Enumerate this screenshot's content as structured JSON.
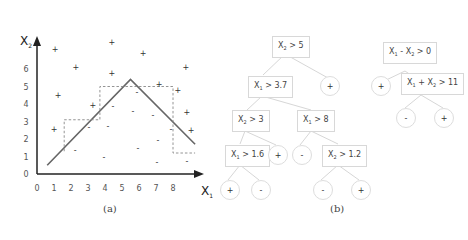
{
  "panel_a": {
    "caption": "(a)",
    "chart_data": {
      "type": "scatter",
      "title": "",
      "xlabel": "X",
      "xlabel_sub": "1",
      "ylabel": "X",
      "ylabel_sub": "2",
      "x_ticks": [
        "0",
        "1",
        "2",
        "3",
        "4",
        "5",
        "6",
        "7",
        "8"
      ],
      "y_ticks": [
        "0",
        "1",
        "2",
        "3",
        "4",
        "5",
        "6"
      ],
      "xlim": [
        0,
        9.5
      ],
      "ylim": [
        0,
        8
      ],
      "grid": false,
      "series": [
        {
          "name": "positive",
          "marker": "+",
          "points": [
            [
              1.06,
              7.14
            ],
            [
              1.24,
              4.51
            ],
            [
              1.0,
              2.57
            ],
            [
              2.29,
              6.11
            ],
            [
              3.29,
              3.94
            ],
            [
              4.41,
              7.54
            ],
            [
              4.41,
              5.77
            ],
            [
              6.24,
              6.86
            ],
            [
              7.18,
              5.14
            ],
            [
              8.29,
              4.8
            ],
            [
              8.76,
              6.06
            ],
            [
              8.82,
              3.49
            ],
            [
              9.06,
              2.46
            ]
          ]
        },
        {
          "name": "negative",
          "marker": "-",
          "points": [
            [
              3.06,
              2.63
            ],
            [
              4.47,
              3.83
            ],
            [
              5.88,
              4.63
            ],
            [
              5.65,
              3.6
            ],
            [
              4.18,
              2.74
            ],
            [
              3.94,
              0.97
            ],
            [
              2.24,
              1.37
            ],
            [
              7.88,
              2.57
            ],
            [
              7.12,
              1.89
            ],
            [
              6.82,
              3.37
            ],
            [
              5.94,
              1.43
            ],
            [
              7.06,
              0.63
            ],
            [
              8.82,
              0.69
            ]
          ]
        }
      ],
      "oblique_boundary": {
        "points": [
          [
            0.6,
            0.5
          ],
          [
            5.5,
            5.4
          ],
          [
            9.3,
            1.7
          ]
        ],
        "style": "solid"
      },
      "axis_parallel_boundary": {
        "points": [
          [
            1.6,
            1.3
          ],
          [
            1.6,
            3.1
          ],
          [
            3.7,
            3.1
          ],
          [
            3.7,
            5.0
          ],
          [
            8.0,
            5.0
          ],
          [
            8.0,
            1.2
          ],
          [
            9.3,
            1.2
          ]
        ],
        "style": "dashed"
      }
    }
  },
  "panel_b": {
    "caption": "(b)",
    "axis_parallel_tree": {
      "nodes": [
        {
          "id": "n1",
          "var": "X",
          "sub": "2",
          "op": "> 5"
        },
        {
          "id": "n2",
          "var": "X",
          "sub": "1",
          "op": "> 3.7"
        },
        {
          "id": "n3",
          "var": "X",
          "sub": "2",
          "op": "> 3"
        },
        {
          "id": "n4",
          "var": "X",
          "sub": "1",
          "op": "> 8"
        },
        {
          "id": "n5",
          "var": "X",
          "sub": "1",
          "op": "> 1.6"
        },
        {
          "id": "n6",
          "var": "X",
          "sub": "2",
          "op": "> 1.2"
        }
      ],
      "leaves": [
        {
          "id": "l1",
          "label": "+"
        },
        {
          "id": "l2",
          "label": "+"
        },
        {
          "id": "l3",
          "label": "-"
        },
        {
          "id": "l4",
          "label": "+"
        },
        {
          "id": "l5",
          "label": "-"
        },
        {
          "id": "l6",
          "label": "-"
        },
        {
          "id": "l7",
          "label": "+"
        }
      ]
    },
    "oblique_tree": {
      "nodes": [
        {
          "id": "o1",
          "text_a": "X",
          "sub_a": "1",
          "mid": " - X",
          "sub_b": "2",
          "op": " > 0"
        },
        {
          "id": "o2",
          "text_a": "X",
          "sub_a": "1",
          "mid": " + X",
          "sub_b": "2",
          "op": " > 11"
        }
      ],
      "leaves": [
        {
          "id": "ol1",
          "label": "+"
        },
        {
          "id": "ol2",
          "label": "-"
        },
        {
          "id": "ol3",
          "label": "+"
        }
      ]
    }
  }
}
